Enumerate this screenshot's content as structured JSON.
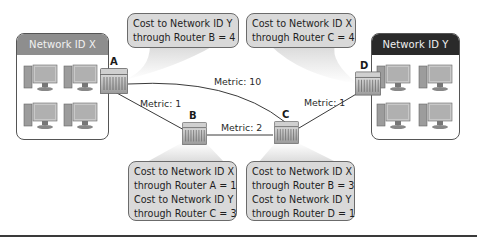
{
  "networks": {
    "x": {
      "title": "Network ID X",
      "header_color": "#8e8e8e",
      "computers": 4
    },
    "y": {
      "title": "Network ID Y",
      "header_color": "#2a2a2a",
      "computers": 4
    }
  },
  "routers": {
    "a": {
      "label": "A"
    },
    "b": {
      "label": "B"
    },
    "c": {
      "label": "C"
    },
    "d": {
      "label": "D"
    }
  },
  "links": {
    "x_a": {
      "from": "Network ID X",
      "to": "A"
    },
    "a_b": {
      "from": "A",
      "to": "B",
      "metric": "Metric: 1"
    },
    "a_c": {
      "from": "A",
      "to": "C",
      "metric": "Metric: 10"
    },
    "b_c": {
      "from": "B",
      "to": "C",
      "metric": "Metric: 2"
    },
    "c_d": {
      "from": "C",
      "to": "D",
      "metric": "Metric: 1"
    },
    "d_y": {
      "from": "D",
      "to": "Network ID Y"
    }
  },
  "bubbles": {
    "a": {
      "router": "A",
      "lines": [
        "Cost to Network ID Y",
        "through Router B = 4"
      ]
    },
    "d": {
      "router": "D",
      "lines": [
        "Cost to Network ID X",
        "through Router C = 4"
      ]
    },
    "b": {
      "router": "B",
      "lines": [
        "Cost to Network ID X",
        "through Router A = 1",
        "Cost to Network ID Y",
        "through Router C = 3"
      ]
    },
    "c": {
      "router": "C",
      "lines": [
        "Cost to Network ID X",
        "through Router B = 3",
        "Cost to Network ID Y",
        "through Router D = 1"
      ]
    }
  },
  "colors": {
    "bubble_fill": "#d9d9d9",
    "bubble_border": "#6b6b6b",
    "line": "#3a3a3a"
  }
}
